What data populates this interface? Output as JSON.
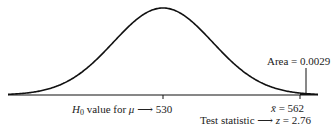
{
  "chart_data": {
    "type": "line",
    "title": "",
    "xlabel": "",
    "ylabel": "",
    "mean": 530,
    "observed": 562,
    "tail_area": 0.0029,
    "z": 2.76,
    "annotations": [
      "H0 value for μ → 530",
      "x̄ = 562",
      "Test statistic → z = 2.76",
      "Area = 0.0029"
    ]
  },
  "labels": {
    "h0_prefix": "H",
    "h0_sub": "0",
    "h0_text": " value for ",
    "mu": "μ",
    "arrow": "⟶",
    "mean_value": "530",
    "xbar": "x̄",
    "xbar_eq": " = 562",
    "test_stat": "Test statistic",
    "z_sym": "z",
    "z_eq": " = 2.76",
    "area": "Area = 0.0029"
  },
  "colors": {
    "curve": "#111111",
    "text": "#222222"
  }
}
